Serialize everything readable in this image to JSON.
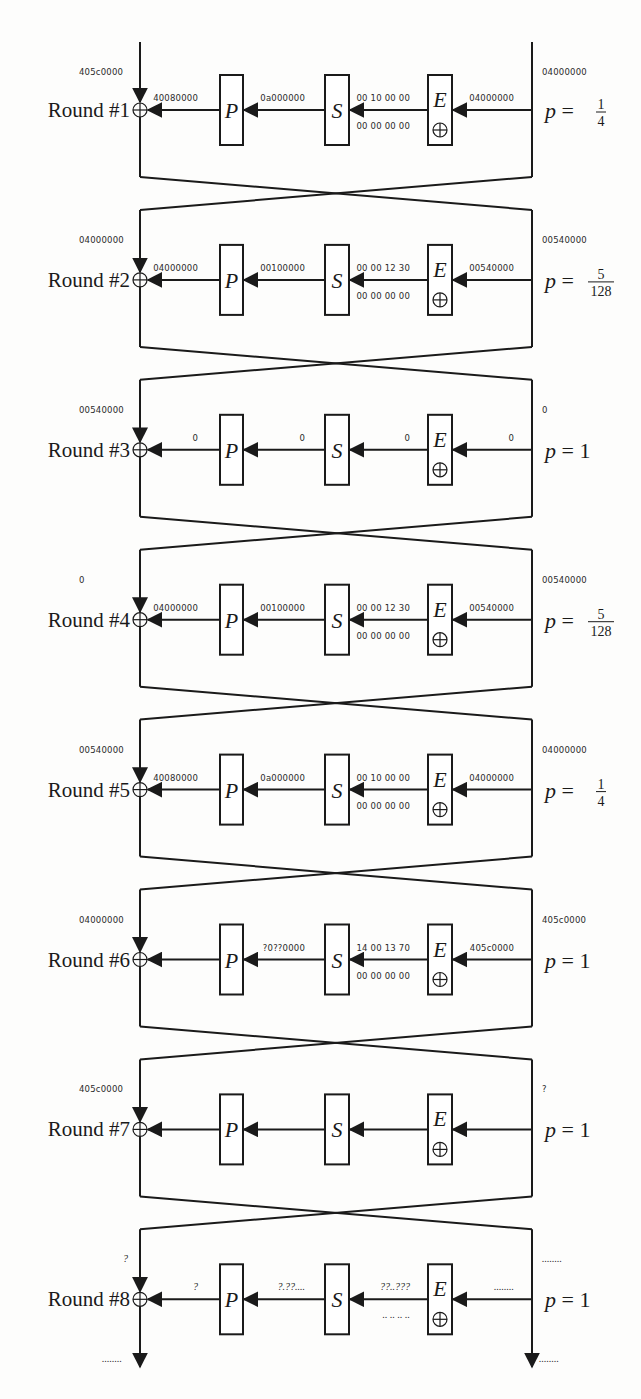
{
  "diagram": {
    "components": {
      "permutation": "P",
      "sbox": "S",
      "expansion": "E"
    },
    "rounds": [
      {
        "label": "Round #1",
        "left_in": "405c0000",
        "right_in": "04000000",
        "p_out": "40080000",
        "s_out": "0a000000",
        "s_in_top": "00 10 00 00",
        "s_in_bottom": "00 00 00 00",
        "e_in": "04000000",
        "prob_type": "frac",
        "prob_num": "1",
        "prob_den": "4",
        "prob_text": "p = 1/4"
      },
      {
        "label": "Round #2",
        "left_in": "04000000",
        "right_in": "00540000",
        "p_out": "04000000",
        "s_out": "00100000",
        "s_in_top": "00 00 12 30",
        "s_in_bottom": "00 00 00 00",
        "e_in": "00540000",
        "prob_type": "frac",
        "prob_num": "5",
        "prob_den": "128",
        "prob_text": "p = 5/128"
      },
      {
        "label": "Round #3",
        "left_in": "00540000",
        "right_in": "0",
        "p_out": "0",
        "s_out": "0",
        "s_in_top": "0",
        "s_in_bottom": "",
        "e_in": "0",
        "prob_type": "int",
        "prob_value": "p = 1",
        "prob_text": "p = 1"
      },
      {
        "label": "Round #4",
        "left_in": "0",
        "right_in": "00540000",
        "p_out": "04000000",
        "s_out": "00100000",
        "s_in_top": "00 00 12 30",
        "s_in_bottom": "00 00 00 00",
        "e_in": "00540000",
        "prob_type": "frac",
        "prob_num": "5",
        "prob_den": "128",
        "prob_text": "p = 5/128"
      },
      {
        "label": "Round #5",
        "left_in": "00540000",
        "right_in": "04000000",
        "p_out": "40080000",
        "s_out": "0a000000",
        "s_in_top": "00 10 00 00",
        "s_in_bottom": "00 00 00 00",
        "e_in": "04000000",
        "prob_type": "frac",
        "prob_num": "1",
        "prob_den": "4",
        "prob_text": "p = 1/4"
      },
      {
        "label": "Round #6",
        "left_in": "04000000",
        "right_in": "405c0000",
        "p_out": "",
        "s_out": "?0??0000",
        "s_in_top": "14 00 13 70",
        "s_in_bottom": "00 00 00 00",
        "e_in": "405c0000",
        "prob_type": "int",
        "prob_value": "p = 1",
        "prob_text": "p = 1"
      },
      {
        "label": "Round #7",
        "left_in": "405c0000",
        "right_in": "?",
        "p_out": "",
        "s_out": "",
        "s_in_top": "",
        "s_in_bottom": "",
        "e_in": "",
        "prob_type": "int",
        "prob_value": "p = 1",
        "prob_text": "p = 1"
      },
      {
        "label": "Round #8",
        "left_in": "?",
        "right_in": "........",
        "p_out": "?",
        "s_out": "?.??....",
        "s_in_top": "??..???",
        "s_in_bottom": ".. .. .. ..",
        "e_in": "........",
        "prob_type": "int",
        "prob_value": "p = 1",
        "prob_text": "p = 1"
      }
    ],
    "outputs": {
      "left_out": "........",
      "right_out": "........"
    },
    "colors": {
      "ink": "#1a1a1a",
      "paper": "#fdfdfc"
    }
  }
}
